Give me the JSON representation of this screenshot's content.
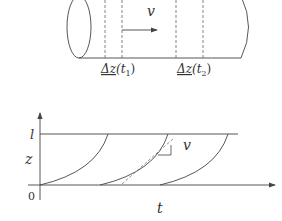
{
  "top_diagram": {
    "velocity_label": "v",
    "segment_labels": [
      {
        "delta": "Δz",
        "arg": "(t",
        "sub": "1",
        "close": ")"
      },
      {
        "delta": "Δz",
        "arg": "(t",
        "sub": "2",
        "close": ")"
      }
    ]
  },
  "bottom_diagram": {
    "y_axis_label": "z",
    "x_axis_label": "t",
    "top_level_label": "l",
    "origin_label": "0",
    "slope_label": "v"
  },
  "colors": {
    "stroke": "#444444",
    "dash": "#666666"
  }
}
